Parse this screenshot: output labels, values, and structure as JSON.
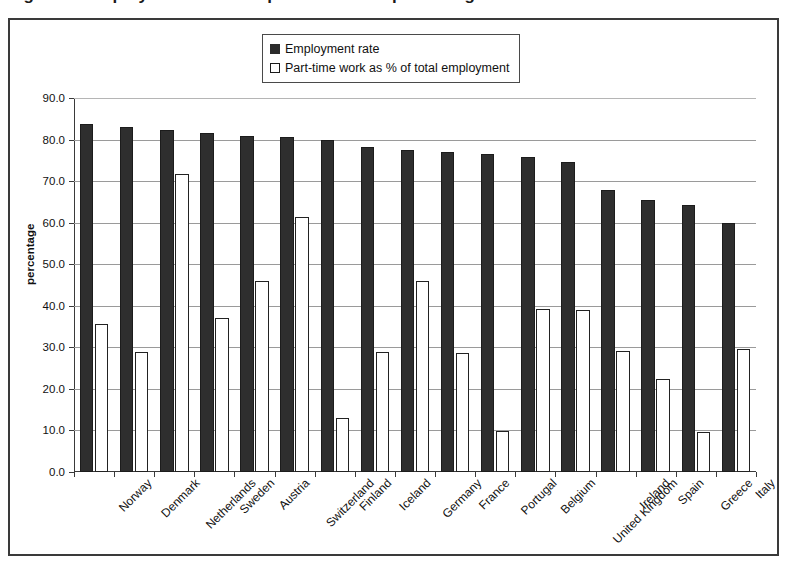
{
  "title_partial": "Figure 1.  Employment rate and part-time work  percentages",
  "legend": {
    "position": "top-center",
    "items": [
      {
        "label": "Employment rate",
        "swatch": "filled-square-icon",
        "color": "#2e2e2e"
      },
      {
        "label": "Part-time work as % of total employment",
        "swatch": "open-square-icon",
        "color": "#ffffff"
      }
    ]
  },
  "axes": {
    "y_title": "percentage",
    "y_ticks": [
      "0.0",
      "10.0",
      "20.0",
      "30.0",
      "40.0",
      "50.0",
      "60.0",
      "70.0",
      "80.0",
      "90.0"
    ]
  },
  "chart_data": {
    "type": "bar",
    "xlabel": "",
    "ylabel": "percentage",
    "ylim": [
      0,
      90
    ],
    "ytick_step": 10,
    "grid": true,
    "legend_position": "top-center",
    "categories": [
      "Norway",
      "Denmark",
      "Netherlands",
      "Sweden",
      "Austria",
      "Switzerland",
      "Finland",
      "Iceland",
      "Germany",
      "France",
      "Portugal",
      "Belgium",
      "United Kingdom",
      "Ireland",
      "Spain",
      "Greece",
      "Italy"
    ],
    "series": [
      {
        "name": "Employment rate",
        "color": "#2e2e2e",
        "values": [
          83.7,
          83.0,
          82.2,
          81.7,
          80.8,
          80.5,
          79.9,
          78.3,
          77.5,
          76.9,
          76.6,
          75.9,
          74.6,
          67.8,
          65.5,
          64.3,
          60.0
        ]
      },
      {
        "name": "Part-time work as % of total employment",
        "color": "#ffffff",
        "values": [
          35.7,
          28.8,
          71.8,
          37.0,
          46.0,
          61.4,
          13.0,
          28.8,
          46.0,
          28.7,
          9.9,
          39.2,
          38.9,
          29.2,
          22.3,
          9.6,
          29.7
        ]
      }
    ]
  }
}
